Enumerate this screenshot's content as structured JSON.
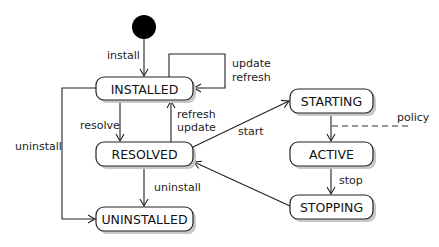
{
  "diagram": {
    "type": "state-machine",
    "initial_state": "INSTALLED",
    "states": [
      {
        "id": "installed",
        "label": "INSTALLED"
      },
      {
        "id": "resolved",
        "label": "RESOLVED"
      },
      {
        "id": "uninstalled",
        "label": "UNINSTALLED"
      },
      {
        "id": "starting",
        "label": "STARTING"
      },
      {
        "id": "active",
        "label": "ACTIVE"
      },
      {
        "id": "stopping",
        "label": "STOPPING"
      }
    ],
    "transitions": [
      {
        "from": "initial",
        "to": "installed",
        "label": "install"
      },
      {
        "from": "installed",
        "to": "installed",
        "label_line1": "update",
        "label_line2": "refresh"
      },
      {
        "from": "installed",
        "to": "resolved",
        "label": "resolve"
      },
      {
        "from": "resolved",
        "to": "installed",
        "label_line1": "refresh",
        "label_line2": "update"
      },
      {
        "from": "installed",
        "to": "uninstalled",
        "label": "uninstall"
      },
      {
        "from": "resolved",
        "to": "uninstalled",
        "label": "uninstall"
      },
      {
        "from": "resolved",
        "to": "starting",
        "label": "start"
      },
      {
        "from": "starting",
        "to": "active",
        "label": "policy",
        "style": "dashed"
      },
      {
        "from": "active",
        "to": "stopping",
        "label": "stop"
      },
      {
        "from": "stopping",
        "to": "resolved",
        "label": ""
      }
    ]
  }
}
